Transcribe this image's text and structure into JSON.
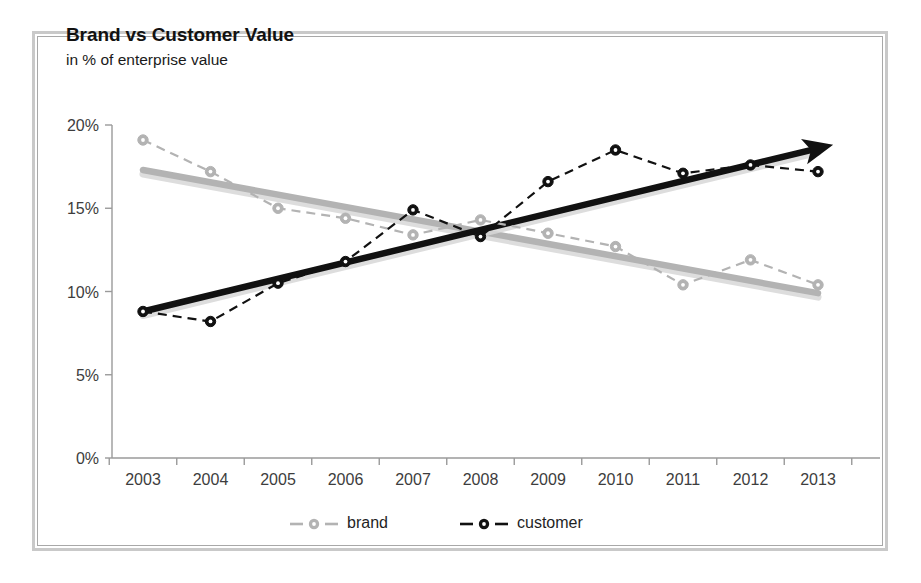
{
  "chart": {
    "title": "Brand vs Customer Value",
    "subtitle": "in % of enterprise value"
  },
  "legend": {
    "items": [
      {
        "label": "brand",
        "color": "#b3b3b3"
      },
      {
        "label": "customer",
        "color": "#111111"
      }
    ]
  },
  "axis": {
    "y_ticks": [
      "0%",
      "5%",
      "10%",
      "15%",
      "20%"
    ],
    "x_ticks": [
      "2003",
      "2004",
      "2005",
      "2006",
      "2007",
      "2008",
      "2009",
      "2010",
      "2011",
      "2012",
      "2013"
    ]
  },
  "chart_data": {
    "type": "line",
    "title": "Brand vs Customer Value",
    "subtitle": "in % of enterprise value",
    "xlabel": "",
    "ylabel": "in % of enterprise value",
    "categories": [
      "2003",
      "2004",
      "2005",
      "2006",
      "2007",
      "2008",
      "2009",
      "2010",
      "2011",
      "2012",
      "2013"
    ],
    "ylim": [
      0,
      20
    ],
    "ytick_values": [
      0,
      5,
      10,
      15,
      20
    ],
    "grid": false,
    "legend_position": "bottom",
    "series": [
      {
        "name": "brand",
        "color": "#b3b3b3",
        "style": "dashed",
        "marker": "circle",
        "values": [
          19.1,
          17.2,
          15.0,
          14.4,
          13.4,
          14.3,
          13.5,
          12.7,
          10.4,
          11.9,
          10.4
        ]
      },
      {
        "name": "customer",
        "color": "#111111",
        "style": "dashed",
        "marker": "circle",
        "values": [
          8.8,
          8.2,
          10.5,
          11.8,
          14.9,
          13.3,
          16.6,
          18.5,
          17.1,
          17.6,
          17.2
        ]
      }
    ],
    "trendlines": [
      {
        "name": "brand-trend",
        "color": "#b3b3b3",
        "start": {
          "x": "2003",
          "y": 17.3
        },
        "end": {
          "x": "2013",
          "y": 9.9
        },
        "arrow": false
      },
      {
        "name": "customer-trend",
        "color": "#111111",
        "start": {
          "x": "2003",
          "y": 8.8
        },
        "end": {
          "x": "2013",
          "y": 18.6
        },
        "arrow": true
      }
    ]
  }
}
